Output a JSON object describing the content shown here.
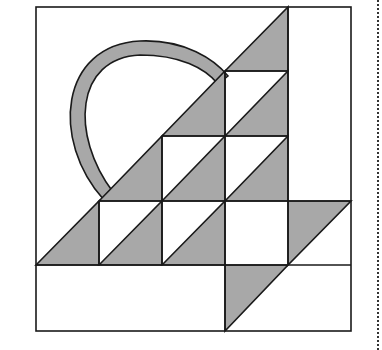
{
  "figure": {
    "colors": {
      "fill": "#a8a8a8",
      "stroke": "#1a1a1a",
      "background": "#ffffff",
      "dots": "#333333"
    },
    "grid": {
      "x": [
        36,
        99,
        162,
        225,
        288,
        351
      ],
      "y": [
        7,
        71,
        136,
        201,
        265,
        331
      ]
    }
  }
}
